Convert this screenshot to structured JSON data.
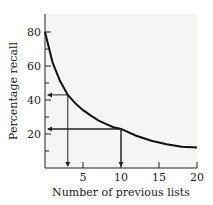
{
  "chart_data": {
    "type": "line",
    "title": "",
    "xlabel": "Number of previous lists",
    "ylabel": "Percentage recall",
    "xlim": [
      0,
      20
    ],
    "ylim": [
      0,
      90
    ],
    "x_ticks": [
      "5",
      "10",
      "15",
      "20"
    ],
    "y_ticks": [
      "20",
      "40",
      "60",
      "80"
    ],
    "grid": false,
    "legend": null,
    "series": [
      {
        "name": "recall",
        "x": [
          0,
          1,
          2,
          3,
          4,
          5,
          6,
          7,
          8,
          9,
          10,
          12,
          14,
          16,
          18,
          20
        ],
        "values": [
          80,
          62,
          51,
          43,
          38,
          34,
          31,
          28,
          26,
          24,
          23,
          19,
          16,
          14,
          12.5,
          12
        ]
      }
    ],
    "annotations": [
      {
        "type": "arrow-pair",
        "x": 3,
        "y": 43,
        "desc": "vertical arrow down to x-axis and horizontal arrow left to y-axis"
      },
      {
        "type": "arrow-pair",
        "x": 10,
        "y": 23,
        "desc": "vertical arrow down to x-axis and horizontal arrow left to y-axis"
      }
    ]
  }
}
